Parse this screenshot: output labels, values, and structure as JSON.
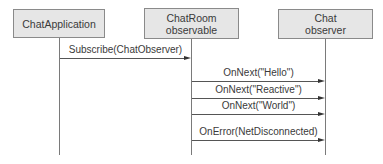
{
  "diagram": {
    "type": "sequence",
    "participants": [
      {
        "id": "app",
        "label": "ChatApplication"
      },
      {
        "id": "room",
        "label": "ChatRoom\nobservable"
      },
      {
        "id": "observer",
        "label": "Chat\nobserver"
      }
    ],
    "messages": [
      {
        "from": "app",
        "to": "room",
        "label": "Subscribe(ChatObserver)"
      },
      {
        "from": "room",
        "to": "observer",
        "label": "OnNext(\"Hello\")"
      },
      {
        "from": "room",
        "to": "observer",
        "label": "OnNext(\"Reactive\")"
      },
      {
        "from": "room",
        "to": "observer",
        "label": "OnNext(\"World\")"
      },
      {
        "from": "room",
        "to": "observer",
        "label": "OnError(NetDisconnected)"
      }
    ],
    "colors": {
      "box_fill": "#e6e6e6",
      "box_border": "#8a8a8a",
      "line": "#555555",
      "text": "#3a3a3a"
    }
  }
}
